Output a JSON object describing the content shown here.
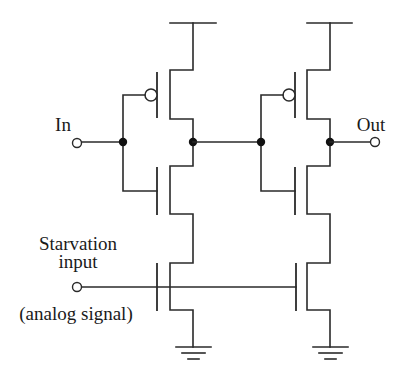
{
  "diagram": {
    "type": "circuit-schematic",
    "labels": {
      "input": "In",
      "output": "Out",
      "starvation_line1": "Starvation",
      "starvation_line2": "input",
      "starvation_note": "(analog signal)"
    },
    "colors": {
      "wire": "#2a2a2a",
      "node": "#111111",
      "background": "#ffffff"
    },
    "components": [
      {
        "id": "P1",
        "kind": "PMOS",
        "stage": 1
      },
      {
        "id": "N1",
        "kind": "NMOS",
        "stage": 1
      },
      {
        "id": "NS1",
        "kind": "NMOS",
        "role": "starvation",
        "stage": 1
      },
      {
        "id": "P2",
        "kind": "PMOS",
        "stage": 2
      },
      {
        "id": "N2",
        "kind": "NMOS",
        "stage": 2
      },
      {
        "id": "NS2",
        "kind": "NMOS",
        "role": "starvation",
        "stage": 2
      }
    ],
    "terminals": [
      "In",
      "Out",
      "Starvation input"
    ],
    "supplies": [
      "VDD rail x2",
      "Ground x2"
    ]
  }
}
